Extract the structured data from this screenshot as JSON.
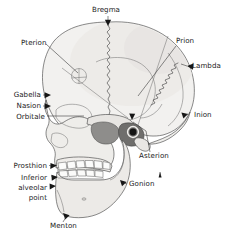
{
  "figure": {
    "width": 228,
    "height": 234,
    "background_color": "#ffffff",
    "line_color": "#3a3a3a",
    "label_color": "#1b1b1b"
  },
  "colors": {
    "cranium_fill": "#f2f1ef",
    "vault_shade": "#e9e8e5",
    "face_fill": "#eeedea",
    "mandible_fill": "#eceae7",
    "teeth_fill": "#fbfbfa",
    "dark_shade": "#8e8d8b",
    "darker_shade": "#6f6e6c",
    "outline": "#4a4a4a",
    "suture": "#3d3d3d",
    "arrow": "#161616"
  },
  "labels": [
    {
      "id": "bregma",
      "text": "Bregma",
      "x": 106,
      "y": 12,
      "anchor": "middle"
    },
    {
      "id": "pterion",
      "text": "Pterion",
      "x": 21,
      "y": 45,
      "anchor": "start"
    },
    {
      "id": "prion",
      "text": "Prion",
      "x": 176,
      "y": 43,
      "anchor": "start"
    },
    {
      "id": "lambda",
      "text": "Lambda",
      "x": 192,
      "y": 68,
      "anchor": "start"
    },
    {
      "id": "gabella",
      "text": "Gabella",
      "x": 41,
      "y": 97,
      "anchor": "end"
    },
    {
      "id": "nasion",
      "text": "Nasion",
      "x": 41,
      "y": 108,
      "anchor": "end"
    },
    {
      "id": "orbitale",
      "text": "Orbitale",
      "x": 45,
      "y": 119,
      "anchor": "end"
    },
    {
      "id": "inion",
      "text": "Inion",
      "x": 194,
      "y": 117,
      "anchor": "start"
    },
    {
      "id": "asterion",
      "text": "Asterion",
      "x": 139,
      "y": 158,
      "anchor": "start"
    },
    {
      "id": "prosthion",
      "text": "Prosthion",
      "x": 47,
      "y": 168,
      "anchor": "end"
    },
    {
      "id": "gonion",
      "text": "Gonion",
      "x": 129,
      "y": 186,
      "anchor": "start"
    },
    {
      "id": "menton",
      "text": "Menton",
      "x": 50,
      "y": 228,
      "anchor": "start"
    }
  ],
  "multiline_labels": [
    {
      "id": "inferior-alveolar-point",
      "lines": [
        "Inferior",
        "alveolar",
        "point"
      ],
      "x": 47,
      "y_start": 180,
      "line_height": 10,
      "anchor": "end"
    }
  ],
  "landmark_list": [
    "Bregma",
    "Pterion",
    "Prion",
    "Lambda",
    "Gabella",
    "Nasion",
    "Orbitale",
    "Inion",
    "Asterion",
    "Prosthion",
    "Inferior alveolar point",
    "Gonion",
    "Menton"
  ]
}
